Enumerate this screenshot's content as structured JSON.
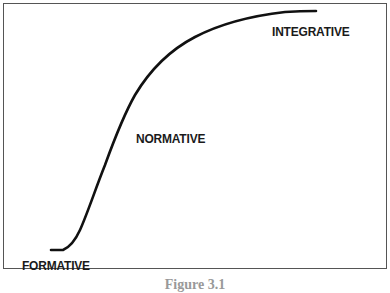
{
  "figure": {
    "caption": "Figure 3.1",
    "labels": {
      "formative": "FORMATIVE",
      "normative": "NORMATIVE",
      "integrative": "INTEGRATIVE"
    },
    "curve": {
      "type": "s-curve",
      "stroke": "#111111"
    }
  }
}
